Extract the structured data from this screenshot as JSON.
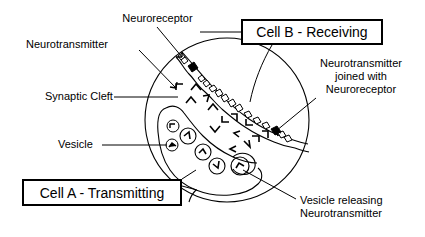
{
  "figure": {
    "background_color": "#ffffff",
    "line_color": "#000000"
  },
  "boxed_labels": [
    {
      "id": "cell_b",
      "text": "Cell B - Receiving"
    },
    {
      "id": "cell_a",
      "text": "Cell A - Transmitting"
    }
  ],
  "callouts": [
    {
      "id": "neuroreceptor",
      "text": "Neuroreceptor",
      "align": "center"
    },
    {
      "id": "neurotransmitter",
      "text": "Neurotransmitter",
      "align": "left"
    },
    {
      "id": "synaptic_cleft",
      "text": "Synaptic Cleft",
      "align": "left"
    },
    {
      "id": "vesicle",
      "text": "Vesicle",
      "align": "left"
    },
    {
      "id": "nt_joined_line1",
      "text": "Neurotransmitter",
      "align": "center"
    },
    {
      "id": "nt_joined_line2",
      "text": "joined with",
      "align": "center"
    },
    {
      "id": "nt_joined_line3",
      "text": "Neuroreceptor",
      "align": "center"
    },
    {
      "id": "vesicle_releasing_l1",
      "text": "Vesicle releasing",
      "align": "left"
    },
    {
      "id": "vesicle_releasing_l2",
      "text": "Neurotransmitter",
      "align": "left"
    }
  ],
  "diagram_elements": {
    "cell_boundary": "large circle enclosing both cells",
    "presynaptic_cell": "Cell A - Transmitting, lower-left region",
    "postsynaptic_cell": "Cell B - Receiving, upper-right region",
    "synaptic_cleft": "gap between the two cell membranes",
    "vesicle_count": 5,
    "free_neurotransmitter_count": 14,
    "bound_neuroreceptor_count": 9
  }
}
